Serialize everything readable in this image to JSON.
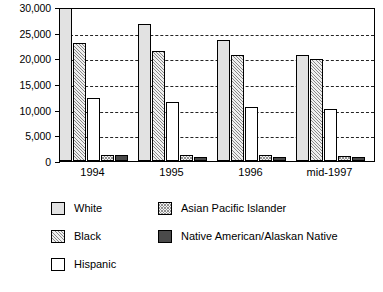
{
  "chart_data": {
    "type": "bar",
    "title": "",
    "subtitle": "",
    "xlabel": "",
    "ylabel": "",
    "categories": [
      "1994",
      "1995",
      "1996",
      "mid-1997"
    ],
    "ylim": [
      0,
      30000
    ],
    "ytick_values": [
      0,
      5000,
      10000,
      15000,
      20000,
      25000,
      30000
    ],
    "ytick_labels": [
      "0",
      "5,000",
      "10,000",
      "15,000",
      "20,000",
      "25,000",
      "30,000"
    ],
    "grid": true,
    "grid_axis": "y",
    "grid_style": "dashed",
    "legend_position": "below",
    "series": [
      {
        "name": "White",
        "key": "white",
        "fill": "light-gray-solid",
        "color": "#e2e2e2",
        "values": [
          30500,
          26600,
          23500,
          20600
        ],
        "clipped": [
          true,
          false,
          false,
          false
        ]
      },
      {
        "name": "Black",
        "key": "black",
        "fill": "light-diagonal-hatch",
        "color": "#efefef",
        "values": [
          23000,
          21400,
          20600,
          19900
        ],
        "clipped": [
          false,
          false,
          false,
          false
        ]
      },
      {
        "name": "Hispanic",
        "key": "hispanic",
        "fill": "white-solid",
        "color": "#ffffff",
        "values": [
          12200,
          11400,
          10600,
          10100
        ],
        "clipped": [
          false,
          false,
          false,
          false
        ]
      },
      {
        "name": "Asian Pacific Islander",
        "key": "api",
        "fill": "checkered-hatch",
        "color": "#f2f2f2",
        "values": [
          1100,
          1100,
          1200,
          900
        ],
        "clipped": [
          false,
          false,
          false,
          false
        ]
      },
      {
        "name": "Native American/Alaskan Native",
        "key": "naan",
        "fill": "dark-gray-solid",
        "color": "#4a4a4a",
        "values": [
          1100,
          700,
          700,
          700
        ],
        "clipped": [
          false,
          false,
          false,
          false
        ]
      }
    ]
  },
  "legend": {
    "column_left": [
      {
        "label": "White",
        "swatch": "legend-swatch-white"
      },
      {
        "label": "Black",
        "swatch": "legend-swatch-black"
      },
      {
        "label": "Hispanic",
        "swatch": "legend-swatch-hispanic"
      }
    ],
    "column_right": [
      {
        "label": "Asian Pacific Islander",
        "swatch": "legend-swatch-api"
      },
      {
        "label": "Native American/Alaskan Native",
        "swatch": "legend-swatch-naan"
      }
    ]
  }
}
